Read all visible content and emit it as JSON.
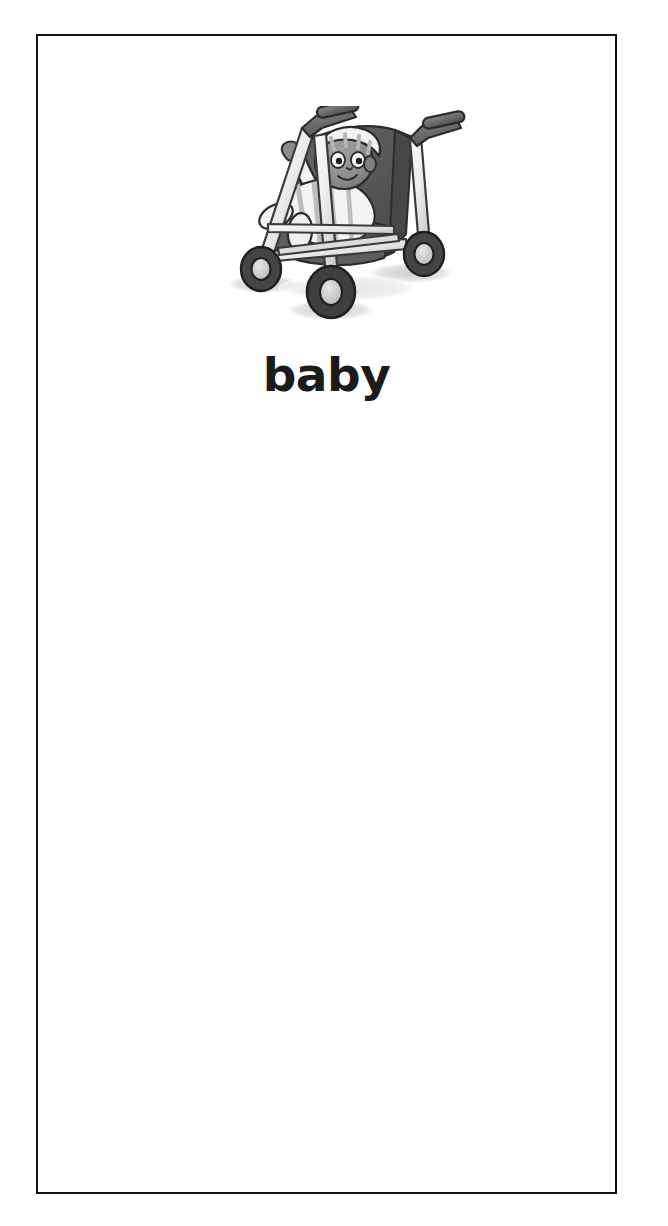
{
  "card": {
    "word": "baby",
    "illustration_name": "baby-in-stroller",
    "illustration_alt": "Grayscale illustration of a baby wearing a striped bonnet and striped outfit, seated in a three-wheeled umbrella stroller",
    "background_color": "#ffffff",
    "border_color": "#141414",
    "text_color": "#1b1b1b"
  },
  "palette": {
    "frame_light": "#f2f2f2",
    "frame_mid": "#d0d0d0",
    "frame_outline": "#3a3a3a",
    "fabric_dark": "#5a5a5a",
    "fabric_darker": "#474747",
    "grip_gray": "#6f6f6f",
    "skin_gray": "#8f8f8f",
    "skin_shadow": "#757575",
    "cloth_white": "#f6f6f6",
    "cloth_stripe": "#b9b9b9",
    "tire_dark": "#3f3f3f",
    "hub_light": "#cccccc",
    "shadow_gray": "#d9d9d9",
    "outline_black": "#1f1f1f"
  }
}
